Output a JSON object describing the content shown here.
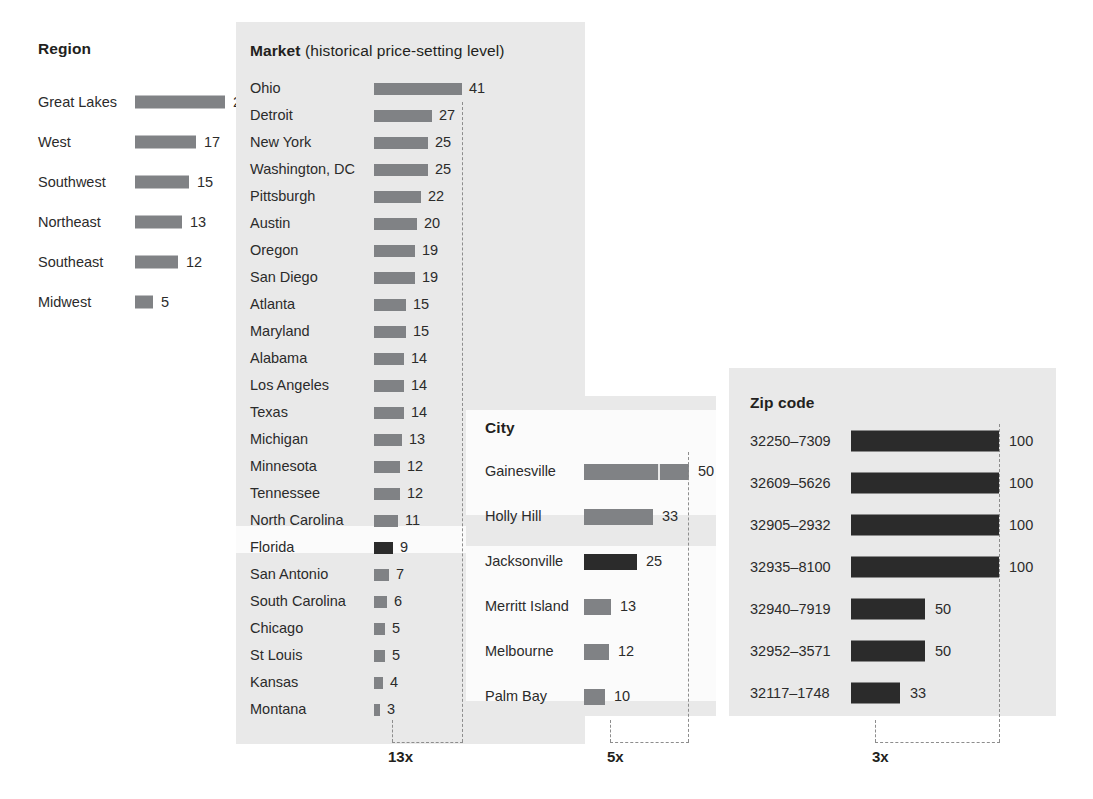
{
  "chart_data": {
    "type": "bar",
    "title": "",
    "xlabel": "",
    "ylabel": "",
    "grid": false,
    "legend": "none",
    "panels": [
      {
        "id": "region",
        "title": "Region",
        "title_suffix": "",
        "shaded": false,
        "categories": [
          "Great Lakes",
          "West",
          "Southwest",
          "Northeast",
          "Southeast",
          "Midwest"
        ],
        "values": [
          25,
          17,
          15,
          13,
          12,
          5
        ],
        "max": 25,
        "bar_color": "#808285",
        "highlight_index": null,
        "multiplier": null
      },
      {
        "id": "market",
        "title": "Market",
        "title_suffix": "(historical price-setting level)",
        "shaded": true,
        "categories": [
          "Ohio",
          "Detroit",
          "New York",
          "Washington, DC",
          "Pittsburgh",
          "Austin",
          "Oregon",
          "San Diego",
          "Atlanta",
          "Maryland",
          "Alabama",
          "Los Angeles",
          "Texas",
          "Michigan",
          "Minnesota",
          "Tennessee",
          "North Carolina",
          "Florida",
          "San Antonio",
          "South Carolina",
          "Chicago",
          "St Louis",
          "Kansas",
          "Montana"
        ],
        "values": [
          41,
          27,
          25,
          25,
          22,
          20,
          19,
          19,
          15,
          15,
          14,
          14,
          14,
          13,
          12,
          12,
          11,
          9,
          7,
          6,
          5,
          5,
          4,
          3
        ],
        "max": 41,
        "bar_color": "#808285",
        "highlight_index": 17,
        "highlight_label": "Florida",
        "highlight_value": 9,
        "highlight_color": "#2b2b2b",
        "multiplier": "13x"
      },
      {
        "id": "city",
        "title": "City",
        "title_suffix": "",
        "shaded": true,
        "categories": [
          "Gainesville",
          "Holly Hill",
          "Jacksonville",
          "Merritt Island",
          "Melbourne",
          "Palm Bay"
        ],
        "values": [
          50,
          33,
          25,
          13,
          12,
          10
        ],
        "max": 50,
        "bar_color": "#808285",
        "highlight_index": 2,
        "highlight_label": "Jacksonville",
        "highlight_value": 25,
        "highlight_color": "#2b2b2b",
        "multiplier": "5x"
      },
      {
        "id": "zip",
        "title": "Zip code",
        "title_suffix": "",
        "shaded": true,
        "categories": [
          "32250–7309",
          "32609–5626",
          "32905–2932",
          "32935–8100",
          "32940–7919",
          "32952–3571",
          "32117–1748"
        ],
        "values": [
          100,
          100,
          100,
          100,
          50,
          50,
          33
        ],
        "max": 100,
        "bar_color": "#2b2b2b",
        "highlight_index": null,
        "multiplier": "3x"
      }
    ]
  },
  "colors": {
    "panel_background": "#e9e9e9",
    "page_background": "#ffffff",
    "bar_gray": "#808285",
    "bar_dark": "#2b2b2b",
    "dashed_line": "#8d8d8d",
    "text": "#231f20"
  },
  "region": {
    "title": "Region",
    "rows": [
      {
        "label": "Great Lakes",
        "value": "25"
      },
      {
        "label": "West",
        "value": "17"
      },
      {
        "label": "Southwest",
        "value": "15"
      },
      {
        "label": "Northeast",
        "value": "13"
      },
      {
        "label": "Southeast",
        "value": "12"
      },
      {
        "label": "Midwest",
        "value": "5"
      }
    ]
  },
  "market": {
    "title": "Market",
    "title_suffix": "(historical price-setting level)",
    "multiplier": "13x",
    "rows": [
      {
        "label": "Ohio",
        "value": "41"
      },
      {
        "label": "Detroit",
        "value": "27"
      },
      {
        "label": "New York",
        "value": "25"
      },
      {
        "label": "Washington, DC",
        "value": "25"
      },
      {
        "label": "Pittsburgh",
        "value": "22"
      },
      {
        "label": "Austin",
        "value": "20"
      },
      {
        "label": "Oregon",
        "value": "19"
      },
      {
        "label": "San Diego",
        "value": "19"
      },
      {
        "label": "Atlanta",
        "value": "15"
      },
      {
        "label": "Maryland",
        "value": "15"
      },
      {
        "label": "Alabama",
        "value": "14"
      },
      {
        "label": "Los Angeles",
        "value": "14"
      },
      {
        "label": "Texas",
        "value": "14"
      },
      {
        "label": "Michigan",
        "value": "13"
      },
      {
        "label": "Minnesota",
        "value": "12"
      },
      {
        "label": "Tennessee",
        "value": "12"
      },
      {
        "label": "North Carolina",
        "value": "11"
      },
      {
        "label": "Florida",
        "value": "9"
      },
      {
        "label": "San Antonio",
        "value": "7"
      },
      {
        "label": "South Carolina",
        "value": "6"
      },
      {
        "label": "Chicago",
        "value": "5"
      },
      {
        "label": "St Louis",
        "value": "5"
      },
      {
        "label": "Kansas",
        "value": "4"
      },
      {
        "label": "Montana",
        "value": "3"
      }
    ]
  },
  "city": {
    "title": "City",
    "multiplier": "5x",
    "rows": [
      {
        "label": "Gainesville",
        "value": "50"
      },
      {
        "label": "Holly Hill",
        "value": "33"
      },
      {
        "label": "Jacksonville",
        "value": "25"
      },
      {
        "label": "Merritt Island",
        "value": "13"
      },
      {
        "label": "Melbourne",
        "value": "12"
      },
      {
        "label": "Palm Bay",
        "value": "10"
      }
    ]
  },
  "zip": {
    "title": "Zip code",
    "multiplier": "3x",
    "rows": [
      {
        "label": "32250–7309",
        "value": "100"
      },
      {
        "label": "32609–5626",
        "value": "100"
      },
      {
        "label": "32905–2932",
        "value": "100"
      },
      {
        "label": "32935–8100",
        "value": "100"
      },
      {
        "label": "32940–7919",
        "value": "50"
      },
      {
        "label": "32952–3571",
        "value": "50"
      },
      {
        "label": "32117–1748",
        "value": "33"
      }
    ]
  }
}
